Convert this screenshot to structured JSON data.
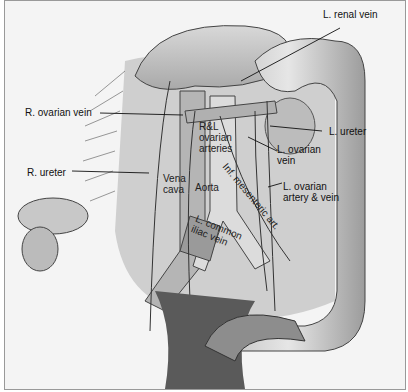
{
  "figure": {
    "labels": {
      "l_renal_vein": "L. renal vein",
      "r_ovarian_vein": "R. ovarian vein",
      "rl_ovarian_arteries": [
        "R&L",
        "ovarian",
        "arteries"
      ],
      "l_ureter": "L. ureter",
      "l_ovarian_vein": [
        "L. ovarian",
        "vein"
      ],
      "r_ureter": "R. ureter",
      "vena_cava": [
        "Vena",
        "cava"
      ],
      "aorta": "Aorta",
      "inf_mesenteric_art": "Inf. mesenteric art.",
      "l_ovarian_artery_vein": [
        "L. ovarian",
        "artery & vein"
      ],
      "l_common_iliac_vein": [
        "L. common",
        "iliac vein"
      ]
    }
  }
}
